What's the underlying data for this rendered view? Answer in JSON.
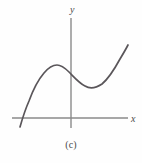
{
  "figure": {
    "caption": "(c)",
    "background_color": "#fefefe",
    "axis_color": "#8a8a8a",
    "curve_color": "#5a565a"
  },
  "chart_data": {
    "type": "line",
    "title": "",
    "subtitle": "",
    "annotation": "(c)",
    "xlabel": "x",
    "ylabel": "y",
    "grid": false,
    "legend": null,
    "axes": {
      "origin_px": [
        71,
        118
      ],
      "x_axis_px": {
        "x_start": 12,
        "x_end": 128,
        "y": 118
      },
      "y_axis_px": {
        "y_top": 18,
        "y_bottom": 128,
        "x": 71
      },
      "x_arrow": false,
      "y_arrow": false,
      "tick_labels_x": [],
      "tick_labels_y": []
    },
    "features": {
      "x_intercept_px": [
        23,
        118
      ],
      "local_maximum_px": [
        56,
        65
      ],
      "y_intercept_px": [
        71,
        72
      ],
      "local_minimum_px": [
        92,
        88
      ],
      "left_endpoint_px": [
        20,
        127
      ],
      "right_endpoint_px": [
        128,
        45
      ]
    },
    "points_px": [
      [
        20,
        127
      ],
      [
        23,
        118
      ],
      [
        28,
        104
      ],
      [
        34,
        90
      ],
      [
        40,
        79
      ],
      [
        46,
        71
      ],
      [
        51,
        67
      ],
      [
        56,
        65
      ],
      [
        61,
        66
      ],
      [
        66,
        69
      ],
      [
        71,
        72
      ],
      [
        76,
        78
      ],
      [
        81,
        83
      ],
      [
        86,
        86
      ],
      [
        92,
        88
      ],
      [
        98,
        87
      ],
      [
        104,
        83
      ],
      [
        110,
        76
      ],
      [
        116,
        67
      ],
      [
        122,
        56
      ],
      [
        128,
        45
      ]
    ],
    "path_d": "M 20 127 C 22 120 25 110 29 101 C 33 90 38 80 44 73 C 49 67 53 65 57 65 C 61 65 65 68 69 72 C 74 77 79 83 85 86 C 90 89 96 88 102 84 C 108 79 114 70 120 59 C 123 54 126 49 128 45"
  }
}
